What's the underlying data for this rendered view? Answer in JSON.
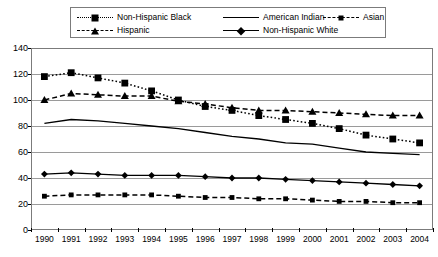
{
  "legend": {
    "position": "top",
    "entries": [
      {
        "label": "Non-Hispanic Black",
        "style": "dotted",
        "marker": "square",
        "col": 0,
        "row": 0
      },
      {
        "label": "Hispanic",
        "style": "dashed",
        "marker": "triangle",
        "col": 0,
        "row": 1
      },
      {
        "label": "American Indian",
        "style": "solid",
        "marker": "none",
        "col": 1,
        "row": 0
      },
      {
        "label": "Non-Hispanic White",
        "style": "solid",
        "marker": "diamond",
        "col": 1,
        "row": 1
      },
      {
        "label": "Asian",
        "style": "dashed",
        "marker": "small-square",
        "col": 2,
        "row": 0
      }
    ]
  },
  "chart_data": {
    "type": "line",
    "title": "",
    "xlabel": "",
    "ylabel": "",
    "xlim": [
      1990,
      2004
    ],
    "ylim": [
      0,
      140
    ],
    "ytick_step": 20,
    "yticks": [
      0,
      20,
      40,
      60,
      80,
      100,
      120,
      140
    ],
    "grid": true,
    "categories": [
      "1990",
      "1991",
      "1992",
      "1993",
      "1994",
      "1995",
      "1996",
      "1997",
      "1998",
      "1999",
      "2000",
      "2001",
      "2002",
      "2003",
      "2004"
    ],
    "series": [
      {
        "name": "Non-Hispanic Black",
        "style": "dotted",
        "marker": "square",
        "values": [
          118,
          121,
          117,
          113,
          107,
          100,
          95,
          92,
          88,
          85,
          82,
          78,
          73,
          70,
          67
        ]
      },
      {
        "name": "Hispanic",
        "style": "dashed",
        "marker": "triangle",
        "values": [
          100,
          105,
          104,
          103,
          103,
          99,
          97,
          94,
          92,
          92,
          91,
          90,
          89,
          88,
          88
        ]
      },
      {
        "name": "American Indian",
        "style": "solid",
        "marker": "none",
        "values": [
          82,
          85,
          84,
          82,
          80,
          78,
          75,
          72,
          70,
          67,
          66,
          63,
          60,
          59,
          58
        ]
      },
      {
        "name": "Non-Hispanic White",
        "style": "solid",
        "marker": "diamond",
        "values": [
          43,
          44,
          43,
          42,
          42,
          42,
          41,
          40,
          40,
          39,
          38,
          37,
          36,
          35,
          34
        ]
      },
      {
        "name": "Asian",
        "style": "dashed",
        "marker": "small-square",
        "values": [
          26,
          27,
          27,
          27,
          27,
          26,
          25,
          25,
          24,
          24,
          23,
          22,
          22,
          21,
          21
        ]
      }
    ]
  },
  "colors": {
    "ink": "#000000",
    "grid": "#9a9a9a",
    "frame": "#7b7b7b",
    "background": "#ffffff"
  }
}
